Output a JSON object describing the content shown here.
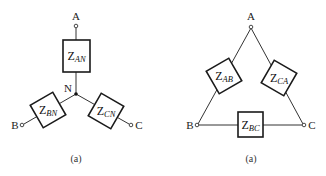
{
  "wye": {
    "terminals": {
      "A": "A",
      "B": "B",
      "C": "C"
    },
    "neutral_label": "N",
    "impedances": {
      "AN": {
        "main": "Z",
        "sub": "AN"
      },
      "BN": {
        "main": "Z",
        "sub": "BN"
      },
      "CN": {
        "main": "Z",
        "sub": "CN"
      }
    },
    "caption": "(a)"
  },
  "delta": {
    "terminals": {
      "A": "A",
      "B": "B",
      "C": "C"
    },
    "impedances": {
      "AB": {
        "main": "Z",
        "sub": "AB"
      },
      "CA": {
        "main": "Z",
        "sub": "CA"
      },
      "BC": {
        "main": "Z",
        "sub": "BC"
      }
    },
    "caption": "(a)"
  },
  "colors": {
    "wire": "#333333",
    "box": "#1a1a1a",
    "background": "#ffffff"
  }
}
